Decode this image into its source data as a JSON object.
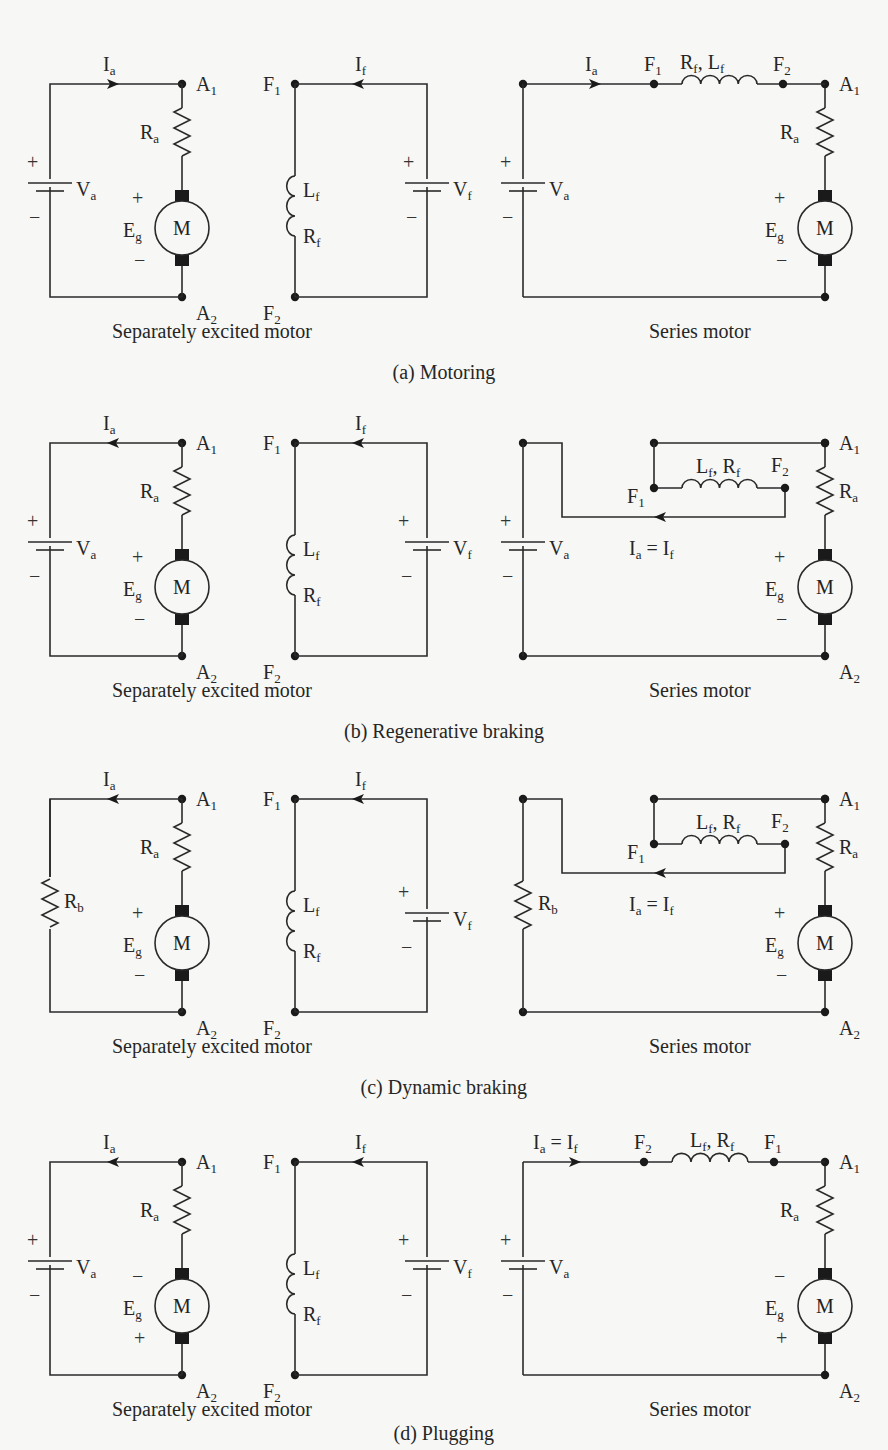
{
  "figure": {
    "panels": [
      {
        "id": "a",
        "caption": "(a) Motoring",
        "separately_excited": {
          "title": "Separately excited motor",
          "armature_source": "V_a",
          "armature_current": "I_a",
          "armature_current_direction": "right",
          "terminals": [
            "A1",
            "A2"
          ],
          "components": [
            "R_a",
            "E_g",
            "M"
          ],
          "eg_polarity_top": "+",
          "eg_polarity_bottom": "−",
          "field": {
            "terminals": [
              "F1",
              "F2"
            ],
            "components": [
              "L_f",
              "R_f"
            ],
            "source": "V_f",
            "current": "I_f",
            "current_direction": "left"
          }
        },
        "series": {
          "title": "Series motor",
          "source": "V_a",
          "current_label": "I_a",
          "field_label": "R_f, L_f",
          "field_terminals_order": [
            "F1",
            "F2"
          ],
          "eg_polarity_top": "+",
          "eg_polarity_bottom": "−",
          "terminals": [
            "A1"
          ]
        }
      },
      {
        "id": "b",
        "caption": "(b) Regenerative braking",
        "separately_excited": {
          "title": "Separately excited motor",
          "armature_source": "V_a",
          "armature_current": "I_a",
          "armature_current_direction": "left",
          "eg_polarity_top": "+",
          "eg_polarity_bottom": "−"
        },
        "series": {
          "title": "Series motor",
          "source": "V_a",
          "current_label": "I_a = I_f",
          "field_label": "L_f, R_f",
          "terminals": [
            "A1",
            "A2",
            "F1",
            "F2"
          ],
          "eg_polarity_top": "+",
          "eg_polarity_bottom": "−"
        }
      },
      {
        "id": "c",
        "caption": "(c) Dynamic braking",
        "separately_excited": {
          "title": "Separately excited motor",
          "armature_load": "R_b",
          "armature_current": "I_a",
          "armature_current_direction": "left",
          "eg_polarity_top": "+",
          "eg_polarity_bottom": "−"
        },
        "series": {
          "title": "Series motor",
          "load": "R_b",
          "current_label": "I_a = I_f",
          "field_label": "L_f, R_f",
          "terminals": [
            "A1",
            "A2",
            "F1",
            "F2"
          ],
          "eg_polarity_top": "+",
          "eg_polarity_bottom": "−"
        }
      },
      {
        "id": "d",
        "caption": "(d) Plugging",
        "separately_excited": {
          "title": "Separately excited motor",
          "armature_source": "V_a",
          "armature_current": "I_a",
          "armature_current_direction": "left",
          "eg_polarity_top": "−",
          "eg_polarity_bottom": "+"
        },
        "series": {
          "title": "Series motor",
          "source": "V_a",
          "current_label": "I_a = I_f",
          "field_label": "L_f, R_f",
          "field_terminals_order": [
            "F2",
            "F1"
          ],
          "terminals": [
            "A1",
            "A2"
          ],
          "eg_polarity_top": "−",
          "eg_polarity_bottom": "+"
        }
      }
    ],
    "labels": {
      "sep_title": "Separately excited motor",
      "series_title": "Series motor",
      "motor": "M",
      "plus": "+",
      "minus": "−"
    }
  }
}
